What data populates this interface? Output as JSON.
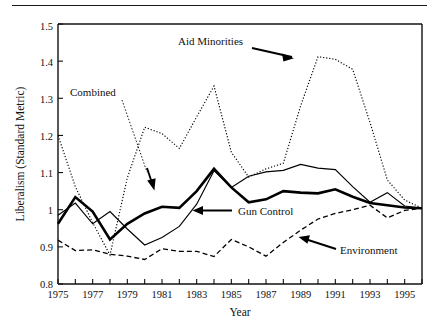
{
  "figure": {
    "name": "liberalism-line-chart",
    "background": "#ffffff",
    "ink_color": "#000000"
  },
  "chart_data": {
    "type": "line",
    "title": "",
    "xlabel": "Year",
    "ylabel": "Liberalism (Standard Metric)",
    "xlim": [
      1975,
      1996
    ],
    "ylim": [
      0.8,
      1.5
    ],
    "xticks": [
      1975,
      1976,
      1977,
      1978,
      1979,
      1980,
      1981,
      1982,
      1983,
      1984,
      1985,
      1986,
      1987,
      1988,
      1989,
      1990,
      1991,
      1992,
      1993,
      1994,
      1995,
      1996
    ],
    "xticklabels": [
      "1975",
      "",
      "1977",
      "",
      "1979",
      "",
      "1981",
      "",
      "1983",
      "",
      "1985",
      "",
      "1987",
      "",
      "1989",
      "",
      "1991",
      "",
      "1993",
      "",
      "1995",
      ""
    ],
    "yticks": [
      0.8,
      0.9,
      1.0,
      1.1,
      1.2,
      1.3,
      1.4,
      1.5
    ],
    "yticklabels": [
      "0.8",
      "0.9",
      "1",
      "1.1",
      "1.2",
      "1.3",
      "1.4",
      "1.5"
    ],
    "grid": false,
    "legend": "annotations-with-arrows",
    "x": [
      1975,
      1976,
      1977,
      1978,
      1979,
      1980,
      1981,
      1982,
      1983,
      1984,
      1985,
      1986,
      1987,
      1988,
      1989,
      1990,
      1991,
      1992,
      1993,
      1994,
      1995,
      1996
    ],
    "series": [
      {
        "name": "Gun Control",
        "style": "solid-thick",
        "values": [
          0.962,
          1.034,
          0.995,
          0.92,
          0.962,
          0.99,
          1.008,
          1.005,
          1.05,
          1.11,
          1.06,
          1.02,
          1.028,
          1.05,
          1.046,
          1.044,
          1.055,
          1.035,
          1.018,
          1.012,
          1.006,
          1.004
        ]
      },
      {
        "name": "Combined",
        "style": "solid-thin",
        "values": [
          0.985,
          1.018,
          0.962,
          0.995,
          0.948,
          0.905,
          0.925,
          0.955,
          1.015,
          1.105,
          1.06,
          1.09,
          1.102,
          1.106,
          1.122,
          1.112,
          1.108,
          1.062,
          1.02,
          1.046,
          1.01,
          1.004
        ]
      },
      {
        "name": "Aid Minorities",
        "style": "dotted",
        "values": [
          1.2,
          1.062,
          0.965,
          0.878,
          1.086,
          1.222,
          1.205,
          1.165,
          1.25,
          1.333,
          1.155,
          1.088,
          1.11,
          1.125,
          1.28,
          1.412,
          1.405,
          1.378,
          1.235,
          1.08,
          1.026,
          1.004
        ]
      },
      {
        "name": "Environment",
        "style": "dashed",
        "values": [
          0.918,
          0.89,
          0.892,
          0.88,
          0.875,
          0.866,
          0.895,
          0.888,
          0.888,
          0.874,
          0.92,
          0.9,
          0.875,
          0.912,
          0.945,
          0.975,
          0.99,
          1.0,
          1.012,
          0.978,
          0.998,
          1.004
        ]
      }
    ],
    "annotations": [
      {
        "text": "Aid Minorities",
        "series": "Aid Minorities",
        "marker": "arrow"
      },
      {
        "text": "Combined",
        "series": "Combined",
        "marker": "arrow"
      },
      {
        "text": "Gun Control",
        "series": "Gun Control",
        "marker": "arrow"
      },
      {
        "text": "Environment",
        "series": "Environment",
        "marker": "arrow"
      }
    ]
  },
  "labels": {
    "y_axis_title": "Liberalism (Standard Metric)",
    "x_axis_title": "Year",
    "aid_minorities": "Aid Minorities",
    "combined": "Combined",
    "gun_control": "Gun Control",
    "environment": "Environment",
    "ytick_0": "0.8",
    "ytick_1": "0.9",
    "ytick_2": "1",
    "ytick_3": "1.1",
    "ytick_4": "1.2",
    "ytick_5": "1.3",
    "ytick_6": "1.4",
    "ytick_7": "1.5",
    "xtick_1975": "1975",
    "xtick_1977": "1977",
    "xtick_1979": "1979",
    "xtick_1981": "1981",
    "xtick_1983": "1983",
    "xtick_1985": "1985",
    "xtick_1987": "1987",
    "xtick_1989": "1989",
    "xtick_1991": "1991",
    "xtick_1993": "1993",
    "xtick_1995": "1995"
  }
}
